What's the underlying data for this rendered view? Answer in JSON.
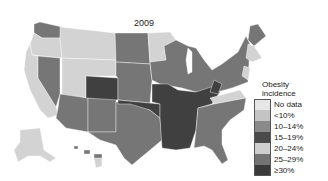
{
  "title": "2009",
  "legend": {
    "title_line1": "Obesity",
    "title_line2": "incidence",
    "items": [
      {
        "label": "No data",
        "color": "#e6e6e6"
      },
      {
        "label": "<10%",
        "color": "#c4c4c4"
      },
      {
        "label": "10–14%",
        "color": "#8a8a8a"
      },
      {
        "label": "15–19%",
        "color": "#4a4a4a"
      },
      {
        "label": "20–24%",
        "color": "#cfcfcf"
      },
      {
        "label": "25–29%",
        "color": "#737373"
      },
      {
        "label": "≥30%",
        "color": "#3a3a3a"
      }
    ]
  },
  "colors": {
    "light": "#d3d3d3",
    "medium": "#767676",
    "dark": "#404040",
    "border": "#ffffff"
  }
}
